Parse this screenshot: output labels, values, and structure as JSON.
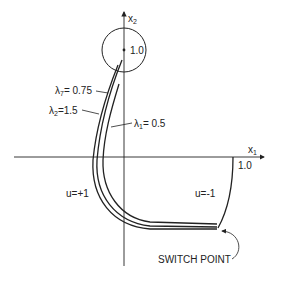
{
  "diagram": {
    "axes": {
      "x_label": "x",
      "x_sub": "1",
      "y_label": "x",
      "y_sub": "2",
      "x_tick_label": "1.0",
      "y_tick_label": "1.0"
    },
    "curves": [
      {
        "lambda_sym": "λ",
        "lambda_sub": "7",
        "lambda_val": "= 0.75"
      },
      {
        "lambda_sym": "λ",
        "lambda_sub": "2",
        "lambda_val": "=1.5"
      },
      {
        "lambda_sym": "λ",
        "lambda_sub": "1",
        "lambda_val": "= 0.5"
      }
    ],
    "regions": {
      "left": "u=+1",
      "right": "u=-1"
    },
    "annotation": "SWITCH POINT",
    "colors": {
      "ink": "#222222",
      "background": "#ffffff"
    }
  }
}
